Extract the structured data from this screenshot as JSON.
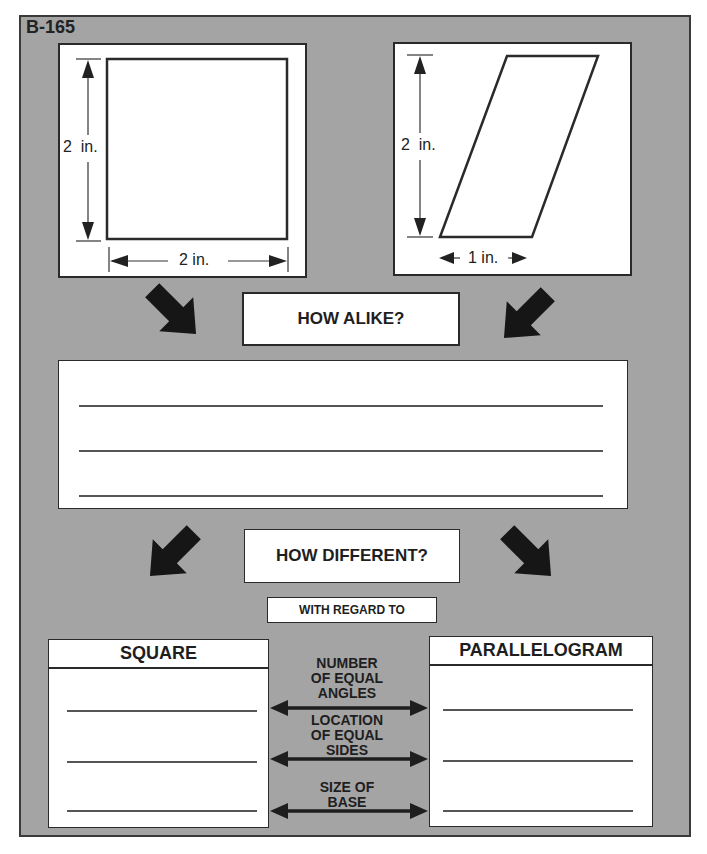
{
  "worksheet": {
    "code": "B-165",
    "colors": {
      "frame": "#a4a4a4",
      "ink": "#1e1e1e",
      "paper": "#ffffff"
    }
  },
  "figures": {
    "square": {
      "name": "square",
      "height_label": "2  in.",
      "width_label": "2 in."
    },
    "parallelogram": {
      "name": "parallelogram",
      "height_label": "2  in.",
      "base_label": "1 in."
    }
  },
  "alike": {
    "prompt": "HOW ALIKE?",
    "answer_lines": [
      "",
      "",
      ""
    ]
  },
  "different": {
    "prompt": "HOW DIFFERENT?",
    "regard_label": "WITH REGARD TO",
    "left_column": {
      "title": "SQUARE",
      "answers": [
        "",
        "",
        ""
      ]
    },
    "right_column": {
      "title": "PARALLELOGRAM",
      "answers": [
        "",
        "",
        ""
      ]
    },
    "criteria": [
      {
        "line1": "NUMBER",
        "line2": "OF EQUAL",
        "line3": "ANGLES"
      },
      {
        "line1": "LOCATION",
        "line2": "OF EQUAL",
        "line3": "SIDES"
      },
      {
        "line1": "SIZE OF",
        "line2": "BASE",
        "line3": ""
      }
    ]
  }
}
